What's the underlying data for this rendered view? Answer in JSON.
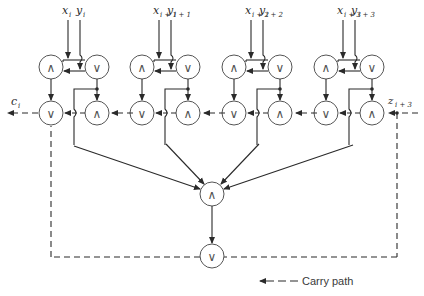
{
  "diagram": {
    "type": "carry-lookahead-logic",
    "stages": [
      {
        "x_label": "x",
        "x_sub": "i",
        "y_label": "y",
        "y_sub": "i"
      },
      {
        "x_label": "x",
        "x_sub": "i + 1",
        "y_label": "y",
        "y_sub": "i + 1"
      },
      {
        "x_label": "x",
        "x_sub": "i + 2",
        "y_label": "y",
        "y_sub": "i + 2"
      },
      {
        "x_label": "x",
        "x_sub": "i + 3",
        "y_label": "y",
        "y_sub": "i + 3"
      }
    ],
    "gate_symbols": {
      "and": "∧",
      "or": "∨"
    },
    "carry_out": {
      "label": "c",
      "sub": "i"
    },
    "carry_in": {
      "label": "z",
      "sub": "i + 3"
    },
    "center_and": {
      "symbol": "∧"
    },
    "bottom_or": {
      "symbol": "∨"
    },
    "legend": {
      "label": "Carry path"
    },
    "colors": {
      "line": "#2a2a2a",
      "gate_stroke": "#555555",
      "background": "#ffffff"
    }
  }
}
